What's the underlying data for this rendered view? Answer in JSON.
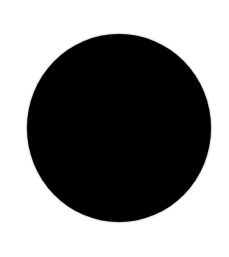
{
  "canvas": {
    "background": "#ffffff"
  },
  "shape": {
    "type": "circle",
    "fill": "#000000"
  }
}
